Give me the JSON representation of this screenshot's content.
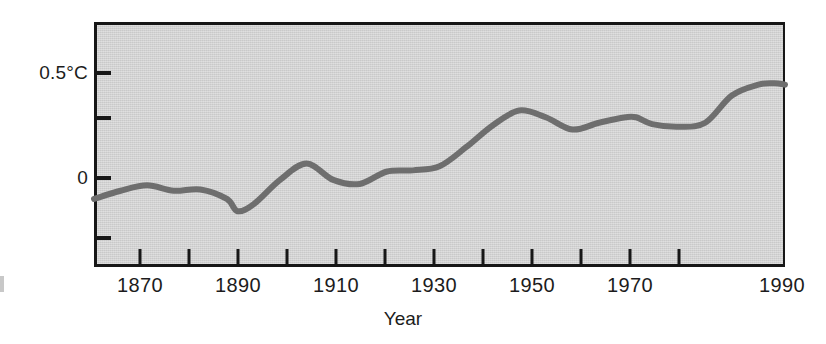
{
  "chart_data": {
    "type": "line",
    "title": "",
    "subtitle": "",
    "xlabel": "Year",
    "ylabel": "",
    "xlim": [
      1860,
      1990
    ],
    "ylim": [
      -0.25,
      0.65
    ],
    "grid": false,
    "legend": null,
    "y_unit": "°C",
    "x_ticks": [
      1870,
      1890,
      1910,
      1930,
      1950,
      1970,
      1990
    ],
    "x_tick_labels": [
      "1870",
      "1890",
      "1910",
      "1930",
      "1950",
      "1970",
      "1990"
    ],
    "x_minor_ticks": [
      1870,
      1880,
      1890,
      1900,
      1910,
      1920,
      1930,
      1940,
      1950,
      1960,
      1970,
      1980,
      1990
    ],
    "y_ticks": [
      -0.25,
      0,
      0.25,
      0.5
    ],
    "y_tick_labels": [
      "",
      "0",
      "",
      "0.5°C"
    ],
    "series": [
      {
        "name": "Global temperature anomaly",
        "color": "#6e6e6e",
        "x": [
          1860,
          1865,
          1870,
          1875,
          1880,
          1885,
          1887,
          1890,
          1895,
          1900,
          1905,
          1910,
          1915,
          1920,
          1925,
          1930,
          1935,
          1940,
          1945,
          1950,
          1955,
          1960,
          1962,
          1965,
          1970,
          1975,
          1980,
          1985,
          1988,
          1990
        ],
        "y": [
          0.0,
          0.03,
          0.05,
          0.03,
          0.035,
          0.0,
          -0.045,
          -0.02,
          0.07,
          0.13,
          0.07,
          0.055,
          0.1,
          0.105,
          0.12,
          0.19,
          0.27,
          0.325,
          0.3,
          0.255,
          0.28,
          0.3,
          0.3,
          0.275,
          0.265,
          0.28,
          0.38,
          0.42,
          0.425,
          0.42
        ]
      }
    ],
    "annotations": []
  },
  "axis": {
    "y_label_high": "0.5°C",
    "y_label_zero": "0",
    "x_title": "Year",
    "x_labels": [
      "1870",
      "1890",
      "1910",
      "1930",
      "1950",
      "1970",
      "1990"
    ]
  },
  "style": {
    "plot_background": "#d5d5d5",
    "frame_color": "#171717",
    "line_color": "#6e6e6e",
    "text_color": "#1c1c1c",
    "page_background": "#ffffff"
  }
}
